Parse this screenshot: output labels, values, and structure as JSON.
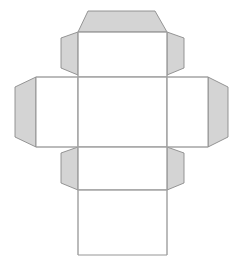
{
  "diagram": {
    "type": "papercraft-net",
    "canvas": {
      "width": 238,
      "height": 267
    },
    "colors": {
      "background": "#ffffff",
      "face_fill": "#ffffff",
      "flap_fill": "#d4d4d4",
      "stroke": "#8a8a8a",
      "stroke_light": "#a8a8a8"
    },
    "stroke_width": 0.9,
    "parts": [
      {
        "id": "top-tuck-flap",
        "name": "top-tuck-flap",
        "kind": "flap",
        "label": "Top tuck flap",
        "points": "88,11 155,11 167,32 78,32"
      },
      {
        "id": "upper-left-glue-flap",
        "name": "upper-left-glue-flap",
        "kind": "flap",
        "label": "Upper left glue flap",
        "points": "78,32 78,75 61,68 61,38"
      },
      {
        "id": "upper-right-glue-flap",
        "name": "upper-right-glue-flap",
        "kind": "flap",
        "label": "Upper right glue flap",
        "points": "167,32 184,38 184,68 167,75"
      },
      {
        "id": "far-left-glue-flap",
        "name": "far-left-glue-flap",
        "kind": "flap",
        "label": "Far left glue flap",
        "points": "36,77 36,147 15,137 15,87"
      },
      {
        "id": "far-right-glue-flap",
        "name": "far-right-glue-flap",
        "kind": "flap",
        "label": "Far right glue flap",
        "points": "208,77 228,87 228,137 208,147"
      },
      {
        "id": "lower-left-glue-flap",
        "name": "lower-left-glue-flap",
        "kind": "flap",
        "label": "Lower left glue flap",
        "points": "78,147 78,190 61,183 61,153"
      },
      {
        "id": "lower-right-glue-flap",
        "name": "lower-right-glue-flap",
        "kind": "flap",
        "label": "Lower right glue flap",
        "points": "167,147 184,153 184,183 167,190"
      },
      {
        "id": "top-face",
        "name": "top-face",
        "kind": "face",
        "label": "Top face",
        "points": "78,32 167,32 167,77 78,77"
      },
      {
        "id": "left-face",
        "name": "left-face",
        "kind": "face",
        "label": "Left face",
        "points": "36,77 78,77 78,147 36,147"
      },
      {
        "id": "front-face",
        "name": "front-face",
        "kind": "face",
        "label": "Front face",
        "points": "78,77 167,77 167,147 78,147"
      },
      {
        "id": "right-face",
        "name": "right-face",
        "kind": "face",
        "label": "Right face",
        "points": "167,77 208,77 208,147 167,147"
      },
      {
        "id": "back-upper-face",
        "name": "back-upper-face",
        "kind": "face",
        "label": "Back upper face",
        "points": "78,147 167,147 167,190 78,190"
      },
      {
        "id": "bottom-face",
        "name": "bottom-face",
        "kind": "face",
        "label": "Bottom face",
        "points": "78,190 167,190 167,255 78,255"
      }
    ],
    "fold_lines": [
      {
        "id": "fold-top-flap",
        "name": "fold-line-top-flap",
        "x1": 78,
        "y1": 32,
        "x2": 167,
        "y2": 32
      },
      {
        "id": "fold-top-face-bottom",
        "name": "fold-line-top-face-bottom",
        "x1": 36,
        "y1": 77,
        "x2": 208,
        "y2": 77
      },
      {
        "id": "fold-front-face-bottom",
        "name": "fold-line-front-face-bottom",
        "x1": 36,
        "y1": 147,
        "x2": 208,
        "y2": 147
      },
      {
        "id": "fold-back-face-bottom",
        "name": "fold-line-back-face-bottom",
        "x1": 78,
        "y1": 190,
        "x2": 167,
        "y2": 190
      },
      {
        "id": "fold-left-vertical",
        "name": "fold-line-left-vertical",
        "x1": 78,
        "y1": 32,
        "x2": 78,
        "y2": 255
      },
      {
        "id": "fold-right-vertical",
        "name": "fold-line-right-vertical",
        "x1": 167,
        "y1": 32,
        "x2": 167,
        "y2": 255
      }
    ]
  }
}
